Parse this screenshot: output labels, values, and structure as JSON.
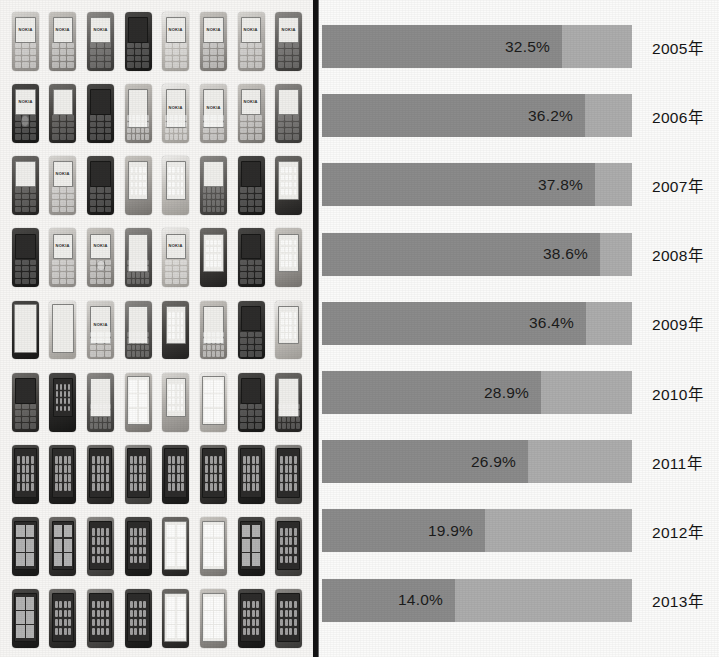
{
  "figure": {
    "left_panel": {
      "name": "nokia-phone-photo-collage",
      "description": "Grid photo collage of Nokia mobile phone handsets",
      "columns": 8,
      "rows": 9
    },
    "colors": {
      "bar_dark": "#8b8b8b",
      "bar_light": "#adadad",
      "divider": "#141414",
      "background": "#fbfbfa",
      "text": "#151515"
    }
  },
  "chart_data": {
    "type": "bar",
    "orientation": "horizontal",
    "stacked": true,
    "title": "",
    "subtitle": "",
    "xlabel": "",
    "ylabel": "",
    "grid": false,
    "legend_position": "none",
    "categories": [
      "2005年",
      "2006年",
      "2007年",
      "2008年",
      "2009年",
      "2010年",
      "2011年",
      "2012年",
      "2013年"
    ],
    "values": [
      32.5,
      36.2,
      37.8,
      38.6,
      36.4,
      28.9,
      26.9,
      19.9,
      14.0
    ],
    "data_labels": [
      "32.5%",
      "36.2%",
      "37.8%",
      "38.6%",
      "36.4%",
      "28.9%",
      "26.9%",
      "19.9%",
      "14.0%"
    ],
    "series": [
      {
        "name": "share",
        "values": [
          32.5,
          36.2,
          37.8,
          38.6,
          36.4,
          28.9,
          26.9,
          19.9,
          14.0
        ]
      }
    ],
    "bar_fill_fraction": [
      0.775,
      0.848,
      0.88,
      0.897,
      0.853,
      0.705,
      0.665,
      0.525,
      0.43
    ]
  },
  "phones": {
    "brand_text": "NOKIA",
    "cells": [
      {
        "body": "body-a",
        "screen": "screen",
        "detail": "keys",
        "brand": true
      },
      {
        "body": "body-d",
        "screen": "screen",
        "detail": "keys",
        "brand": true
      },
      {
        "body": "body-b",
        "screen": "screen",
        "detail": "keys",
        "brand": true
      },
      {
        "body": "body-c",
        "screen": "screen dark",
        "detail": "keys",
        "brand": false,
        "stylus": true
      },
      {
        "body": "body-f",
        "screen": "screen",
        "detail": "keys",
        "brand": true
      },
      {
        "body": "body-d",
        "screen": "screen",
        "detail": "keys",
        "brand": true
      },
      {
        "body": "body-a",
        "screen": "screen",
        "detail": "keys",
        "brand": true
      },
      {
        "body": "body-b",
        "screen": "screen",
        "detail": "keys",
        "brand": true
      },
      {
        "body": "body-c",
        "screen": "screen",
        "detail": "navpad",
        "brand": true
      },
      {
        "body": "body-e",
        "screen": "screen",
        "detail": "keys",
        "brand": false
      },
      {
        "body": "body-c",
        "screen": "screen dark",
        "detail": "keys",
        "brand": false
      },
      {
        "body": "body-d",
        "screen": "screen tall",
        "detail": "keys qwerty",
        "brand": false
      },
      {
        "body": "body-f",
        "screen": "screen tall",
        "detail": "keys qwerty",
        "brand": true
      },
      {
        "body": "body-a",
        "screen": "screen tall",
        "detail": "keys",
        "brand": true
      },
      {
        "body": "body-d",
        "screen": "screen",
        "detail": "keys",
        "brand": true
      },
      {
        "body": "body-b",
        "screen": "screen",
        "detail": "keys",
        "brand": false
      },
      {
        "body": "body-e",
        "screen": "screen",
        "detail": "keys",
        "brand": false
      },
      {
        "body": "body-a",
        "screen": "screen",
        "detail": "keys",
        "brand": true
      },
      {
        "body": "body-c",
        "screen": "screen dark",
        "detail": "keys",
        "brand": false
      },
      {
        "body": "body-d",
        "screen": "screen tall",
        "detail": "icongrid",
        "brand": false
      },
      {
        "body": "body-f",
        "screen": "screen tall",
        "detail": "icongrid",
        "brand": false
      },
      {
        "body": "body-b",
        "screen": "screen",
        "detail": "keys qwerty",
        "brand": false
      },
      {
        "body": "body-c",
        "screen": "screen dark",
        "detail": "keys",
        "brand": false
      },
      {
        "body": "body-e",
        "screen": "screen tall",
        "detail": "icongrid",
        "brand": false
      },
      {
        "body": "body-c",
        "screen": "screen dark",
        "detail": "keys",
        "brand": false
      },
      {
        "body": "body-a",
        "screen": "screen",
        "detail": "keys",
        "brand": true
      },
      {
        "body": "body-d",
        "screen": "screen",
        "detail": "navpad",
        "brand": true
      },
      {
        "body": "body-b",
        "screen": "screen tall",
        "detail": "keys qwerty",
        "brand": false
      },
      {
        "body": "body-f",
        "screen": "screen",
        "detail": "keys",
        "brand": true
      },
      {
        "body": "body-e",
        "screen": "screen tall",
        "detail": "icongrid",
        "brand": false
      },
      {
        "body": "body-c",
        "screen": "screen dark",
        "detail": "keys",
        "brand": false
      },
      {
        "body": "body-d",
        "screen": "screen tall",
        "detail": "icongrid",
        "brand": false
      },
      {
        "body": "body-c",
        "screen": "screen huge",
        "detail": "none",
        "brand": false
      },
      {
        "body": "body-f",
        "screen": "screen huge",
        "detail": "none",
        "brand": false
      },
      {
        "body": "body-a",
        "screen": "screen tall",
        "detail": "keys",
        "brand": true
      },
      {
        "body": "body-b",
        "screen": "screen tall",
        "detail": "keys qwerty",
        "brand": false
      },
      {
        "body": "body-e",
        "screen": "screen tall",
        "detail": "icongrid",
        "brand": false
      },
      {
        "body": "body-d",
        "screen": "screen tall",
        "detail": "keys qwerty",
        "brand": false
      },
      {
        "body": "body-c",
        "screen": "screen dark",
        "detail": "keys",
        "brand": false
      },
      {
        "body": "body-f",
        "screen": "screen tall",
        "detail": "icongrid",
        "brand": false
      },
      {
        "body": "body-e",
        "screen": "screen dark",
        "detail": "keys",
        "brand": false
      },
      {
        "body": "body-c",
        "screen": "screen dark tall",
        "detail": "icongrid",
        "brand": false
      },
      {
        "body": "body-b",
        "screen": "screen tall",
        "detail": "keys qwerty",
        "brand": false
      },
      {
        "body": "body-d",
        "screen": "screen huge",
        "detail": "tiles",
        "brand": false
      },
      {
        "body": "body-a",
        "screen": "screen tall",
        "detail": "icongrid",
        "brand": false
      },
      {
        "body": "body-f",
        "screen": "screen huge",
        "detail": "tiles",
        "brand": false
      },
      {
        "body": "body-c",
        "screen": "screen dark",
        "detail": "keys",
        "brand": false
      },
      {
        "body": "body-e",
        "screen": "screen tall",
        "detail": "keys qwerty",
        "brand": false
      },
      {
        "body": "body-c",
        "screen": "screen dark huge",
        "detail": "icongrid",
        "brand": false
      },
      {
        "body": "body-c",
        "screen": "screen dark huge",
        "detail": "icongrid",
        "brand": false
      },
      {
        "body": "body-e",
        "screen": "screen dark huge",
        "detail": "icongrid",
        "brand": false
      },
      {
        "body": "body-b",
        "screen": "screen dark huge",
        "detail": "icongrid",
        "brand": false
      },
      {
        "body": "body-c",
        "screen": "screen dark huge",
        "detail": "icongrid",
        "brand": false
      },
      {
        "body": "body-e",
        "screen": "screen dark huge",
        "detail": "icongrid",
        "brand": false
      },
      {
        "body": "body-c",
        "screen": "screen dark huge",
        "detail": "icongrid",
        "brand": false
      },
      {
        "body": "body-b",
        "screen": "screen dark huge",
        "detail": "icongrid",
        "brand": false
      },
      {
        "body": "body-c",
        "screen": "screen dark huge",
        "detail": "tiles",
        "brand": false
      },
      {
        "body": "body-e",
        "screen": "screen dark huge",
        "detail": "tiles",
        "brand": false
      },
      {
        "body": "body-b",
        "screen": "screen dark huge",
        "detail": "icongrid",
        "brand": false
      },
      {
        "body": "body-c",
        "screen": "screen dark huge",
        "detail": "icongrid",
        "brand": false
      },
      {
        "body": "body-e",
        "screen": "screen huge",
        "detail": "tiles",
        "brand": false
      },
      {
        "body": "body-d",
        "screen": "screen huge",
        "detail": "tiles",
        "brand": false
      },
      {
        "body": "body-c",
        "screen": "screen dark huge",
        "detail": "tiles",
        "brand": false
      },
      {
        "body": "body-b",
        "screen": "screen dark huge",
        "detail": "icongrid",
        "brand": false
      },
      {
        "body": "body-c",
        "screen": "screen dark huge",
        "detail": "tiles",
        "brand": false
      },
      {
        "body": "body-e",
        "screen": "screen dark huge",
        "detail": "icongrid",
        "brand": false
      },
      {
        "body": "body-b",
        "screen": "screen dark huge",
        "detail": "icongrid",
        "brand": false
      },
      {
        "body": "body-c",
        "screen": "screen dark huge",
        "detail": "icongrid",
        "brand": false
      },
      {
        "body": "body-e",
        "screen": "screen huge",
        "detail": "tiles",
        "brand": false
      },
      {
        "body": "body-d",
        "screen": "screen huge",
        "detail": "tiles",
        "brand": false
      },
      {
        "body": "body-c",
        "screen": "screen dark huge",
        "detail": "icongrid",
        "brand": false
      },
      {
        "body": "body-b",
        "screen": "screen dark huge",
        "detail": "icongrid",
        "brand": false
      }
    ]
  }
}
